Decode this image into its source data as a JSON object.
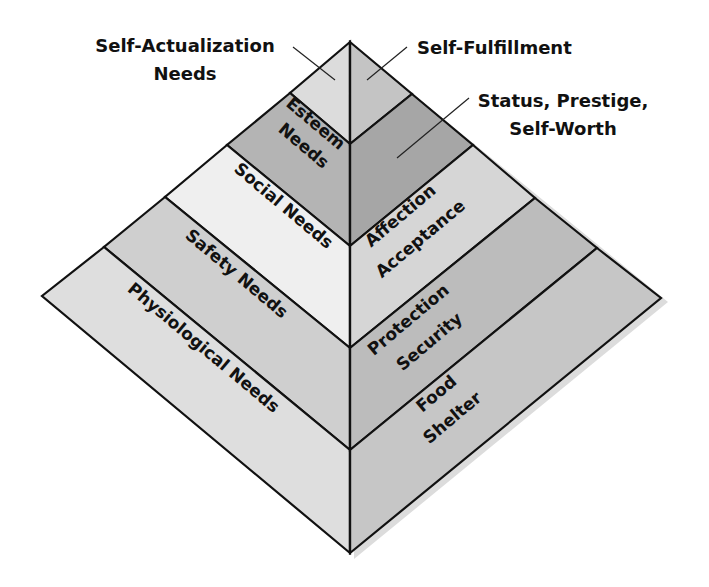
{
  "colors": {
    "outline": "#111111",
    "shadow": "#d8d8d8",
    "left": {
      "self_actualization": "#dcdcdc",
      "esteem": "#b4b4b4",
      "social": "#efefef",
      "safety": "#cfcfcf",
      "physiological": "#dedede"
    },
    "right": {
      "self_actualization": "#c4c4c4",
      "esteem": "#a6a6a6",
      "social": "#d6d6d6",
      "safety": "#bcbcbc",
      "physiological": "#c6c6c6"
    }
  },
  "callouts": {
    "self_actualization_line1": "Self-Actualization",
    "self_actualization_line2": "Needs",
    "self_fulfillment": "Self-Fulfillment",
    "status_line1": "Status, Prestige,",
    "status_line2": "Self-Worth"
  },
  "levels": [
    {
      "id": "self_actualization",
      "left_label": "",
      "right_label": ""
    },
    {
      "id": "esteem",
      "left_label_line1": "Esteem",
      "left_label_line2": "Needs"
    },
    {
      "id": "social",
      "left_label": "Social Needs",
      "right_label_line1": "Affection",
      "right_label_line2": "Acceptance"
    },
    {
      "id": "safety",
      "left_label": "Safety Needs",
      "right_label_line1": "Protection",
      "right_label_line2": "Security"
    },
    {
      "id": "physiological",
      "left_label": "Physiological Needs",
      "right_label_line1": "Food",
      "right_label_line2": "Shelter"
    }
  ]
}
